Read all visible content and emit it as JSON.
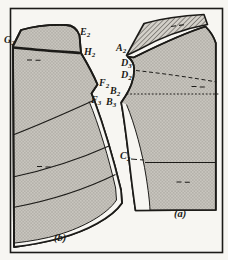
{
  "figure": {
    "caption_a": "(a)",
    "caption_b": "(b)"
  },
  "labels": {
    "g2": {
      "base": "G",
      "sub": "2"
    },
    "e2": {
      "base": "E",
      "sub": "2"
    },
    "h2": {
      "base": "H",
      "sub": "2"
    },
    "f2": {
      "base": "F",
      "sub": "2"
    },
    "f3": {
      "base": "F",
      "sub": "3"
    },
    "a2": {
      "base": "A",
      "sub": "2"
    },
    "d3": {
      "base": "D",
      "sub": "3"
    },
    "d2": {
      "base": "D",
      "sub": "2"
    },
    "b2": {
      "base": "B",
      "sub": "2"
    },
    "b3": {
      "base": "B",
      "sub": "3"
    },
    "c2": {
      "base": "C",
      "sub": "2"
    }
  },
  "colors": {
    "ink": "#1c1b18",
    "paper": "#f7f6f2",
    "shade": "#c9c6bf",
    "shade_dot": "#8f8c84",
    "hatch_bg": "#d3d0c9",
    "hatch_line": "#4a4742"
  }
}
